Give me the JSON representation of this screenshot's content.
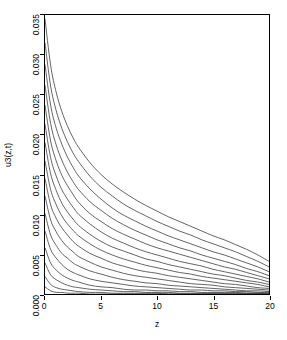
{
  "chart_data": {
    "type": "line",
    "title": "",
    "subtitle": "",
    "xlabel": "z",
    "ylabel": "u3(z,t)",
    "xlim": [
      0,
      20
    ],
    "ylim": [
      0,
      0.035
    ],
    "xticks": [
      0,
      5,
      10,
      15,
      20
    ],
    "xtick_labels": [
      "0",
      "5",
      "10",
      "15",
      "20"
    ],
    "yticks": [
      0.0,
      0.005,
      0.01,
      0.015,
      0.02,
      0.025,
      0.03,
      0.035
    ],
    "ytick_labels": [
      "0.000",
      "0.005",
      "0.010",
      "0.015",
      "0.020",
      "0.025",
      "0.030",
      "0.035"
    ],
    "grid": false,
    "legend": "none",
    "line_color": "#3c3c3c",
    "line_width": 0.8,
    "background": "#ffffff",
    "frame": true,
    "n_series": 16,
    "x": [
      0,
      0.5,
      1,
      1.5,
      2,
      2.5,
      3,
      4,
      5,
      6,
      7,
      8,
      9,
      10,
      11,
      12,
      13,
      14,
      15,
      16,
      17,
      18,
      19,
      20
    ],
    "series": [
      {
        "name": "t1",
        "values": [
          0.0345,
          0.0287,
          0.0253,
          0.0229,
          0.0211,
          0.0196,
          0.0184,
          0.0165,
          0.015,
          0.0138,
          0.0128,
          0.0119,
          0.0111,
          0.0104,
          0.0097,
          0.0091,
          0.0085,
          0.0079,
          0.0073,
          0.0068,
          0.0062,
          0.0056,
          0.0049,
          0.0041
        ]
      },
      {
        "name": "t2",
        "values": [
          0.0315,
          0.0261,
          0.023,
          0.0208,
          0.0191,
          0.0177,
          0.0166,
          0.0148,
          0.0134,
          0.0123,
          0.0113,
          0.0105,
          0.0098,
          0.0091,
          0.0085,
          0.0079,
          0.0074,
          0.0068,
          0.0063,
          0.0058,
          0.0053,
          0.0047,
          0.0041,
          0.0034
        ]
      },
      {
        "name": "t3",
        "values": [
          0.0288,
          0.0237,
          0.0208,
          0.0188,
          0.0172,
          0.0159,
          0.0148,
          0.0132,
          0.0119,
          0.0108,
          0.0099,
          0.0092,
          0.0085,
          0.0079,
          0.0073,
          0.0068,
          0.0063,
          0.0058,
          0.0053,
          0.0049,
          0.0044,
          0.0039,
          0.0034,
          0.0028
        ]
      },
      {
        "name": "t4",
        "values": [
          0.0262,
          0.0214,
          0.0187,
          0.0168,
          0.0153,
          0.0141,
          0.0131,
          0.0116,
          0.0105,
          0.0095,
          0.0087,
          0.008,
          0.0074,
          0.0068,
          0.0063,
          0.0058,
          0.0054,
          0.0049,
          0.0045,
          0.0041,
          0.0037,
          0.0032,
          0.0028,
          0.0023
        ]
      },
      {
        "name": "t5",
        "values": [
          0.0237,
          0.0192,
          0.0167,
          0.0149,
          0.0136,
          0.0125,
          0.0115,
          0.0101,
          0.0091,
          0.0082,
          0.0075,
          0.0069,
          0.0063,
          0.0058,
          0.0054,
          0.005,
          0.0046,
          0.0042,
          0.0038,
          0.0034,
          0.0031,
          0.0027,
          0.0023,
          0.0019
        ]
      },
      {
        "name": "t6",
        "values": [
          0.0213,
          0.0171,
          0.0148,
          0.0131,
          0.0119,
          0.0109,
          0.01,
          0.0088,
          0.0078,
          0.007,
          0.0064,
          0.0058,
          0.0053,
          0.0049,
          0.0045,
          0.0041,
          0.0038,
          0.0035,
          0.0031,
          0.0028,
          0.0025,
          0.0022,
          0.0019,
          0.0015
        ]
      },
      {
        "name": "t7",
        "values": [
          0.019,
          0.0151,
          0.013,
          0.0114,
          0.0103,
          0.0094,
          0.0086,
          0.0075,
          0.0066,
          0.0059,
          0.0054,
          0.0049,
          0.0044,
          0.0041,
          0.0037,
          0.0034,
          0.0031,
          0.0028,
          0.0025,
          0.0023,
          0.002,
          0.0017,
          0.0015,
          0.0012
        ]
      },
      {
        "name": "t8",
        "values": [
          0.0167,
          0.0131,
          0.0112,
          0.0098,
          0.0088,
          0.008,
          0.0073,
          0.0063,
          0.0055,
          0.0049,
          0.0044,
          0.004,
          0.0036,
          0.0033,
          0.003,
          0.0027,
          0.0025,
          0.0022,
          0.002,
          0.0018,
          0.0016,
          0.0014,
          0.0012,
          0.0009
        ]
      },
      {
        "name": "t9",
        "values": [
          0.0145,
          0.0112,
          0.0095,
          0.0083,
          0.0074,
          0.0066,
          0.006,
          0.0051,
          0.0045,
          0.0039,
          0.0035,
          0.0031,
          0.0028,
          0.0026,
          0.0023,
          0.0021,
          0.0019,
          0.0017,
          0.0015,
          0.0013,
          0.0012,
          0.001,
          0.0008,
          0.0007
        ]
      },
      {
        "name": "t10",
        "values": [
          0.0123,
          0.0093,
          0.0078,
          0.0067,
          0.0059,
          0.0053,
          0.0047,
          0.004,
          0.0034,
          0.003,
          0.0026,
          0.0023,
          0.0021,
          0.0019,
          0.0017,
          0.0015,
          0.0013,
          0.0012,
          0.0011,
          0.0009,
          0.0008,
          0.0007,
          0.0006,
          0.0005
        ]
      },
      {
        "name": "t11",
        "values": [
          0.0101,
          0.0074,
          0.0061,
          0.0051,
          0.0045,
          0.0039,
          0.0035,
          0.0029,
          0.0025,
          0.0021,
          0.0018,
          0.0016,
          0.0014,
          0.0013,
          0.0011,
          0.001,
          0.0009,
          0.0008,
          0.0007,
          0.0006,
          0.0005,
          0.0004,
          0.0004,
          0.0003
        ]
      },
      {
        "name": "t12",
        "values": [
          0.0079,
          0.0056,
          0.0045,
          0.0037,
          0.0031,
          0.0027,
          0.0024,
          0.0019,
          0.0016,
          0.0014,
          0.0012,
          0.001,
          0.0009,
          0.0008,
          0.0007,
          0.0006,
          0.0005,
          0.0005,
          0.0004,
          0.0004,
          0.0003,
          0.0003,
          0.0002,
          0.0002
        ]
      },
      {
        "name": "t13",
        "values": [
          0.0058,
          0.0039,
          0.003,
          0.0024,
          0.002,
          0.0017,
          0.0015,
          0.0011,
          0.0009,
          0.0008,
          0.0006,
          0.0005,
          0.0005,
          0.0004,
          0.0004,
          0.0003,
          0.0003,
          0.0002,
          0.0002,
          0.0002,
          0.0002,
          0.0001,
          0.0001,
          0.0001
        ]
      },
      {
        "name": "t14",
        "values": [
          0.0039,
          0.0024,
          0.0018,
          0.0014,
          0.0011,
          0.0009,
          0.0008,
          0.0006,
          0.0005,
          0.0004,
          0.0003,
          0.0003,
          0.0002,
          0.0002,
          0.0002,
          0.0001,
          0.0001,
          0.0001,
          0.0001,
          0.0001,
          0.0001,
          0.0001,
          0.0001,
          0.0
        ]
      },
      {
        "name": "t15",
        "values": [
          0.0022,
          0.0012,
          0.0008,
          0.0006,
          0.0005,
          0.0004,
          0.0003,
          0.0002,
          0.0002,
          0.0001,
          0.0001,
          0.0001,
          0.0001,
          0.0001,
          0.0,
          0.0,
          0.0,
          0.0,
          0.0,
          0.0,
          0.0,
          0.0,
          0.0,
          0.0
        ]
      },
      {
        "name": "t16",
        "values": [
          0.0009,
          0.0004,
          0.0002,
          0.0002,
          0.0001,
          0.0001,
          0.0001,
          0.0,
          0.0,
          0.0,
          0.0,
          0.0,
          0.0,
          0.0,
          0.0,
          0.0,
          0.0,
          0.0,
          0.0,
          0.0,
          0.0,
          0.0,
          0.0,
          0.0
        ]
      }
    ]
  }
}
